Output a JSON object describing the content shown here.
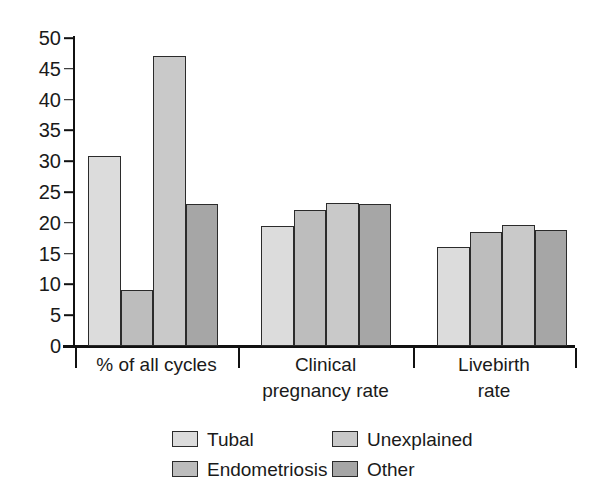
{
  "chart_data": {
    "type": "bar",
    "title": "",
    "subtitle": "",
    "xlabel": "",
    "ylabel": "",
    "ylim": [
      0,
      50
    ],
    "yticks": [
      0,
      5,
      10,
      15,
      20,
      25,
      30,
      35,
      40,
      45,
      50
    ],
    "ytick_labels": [
      "0",
      "5",
      "10",
      "15",
      "20",
      "25",
      "30",
      "35",
      "40",
      "45",
      "50"
    ],
    "grid": false,
    "legend_position": "bottom",
    "categories": [
      "% of all cycles",
      "Clinical\npregnancy rate",
      "Livebirth\nrate"
    ],
    "series": [
      {
        "name": "Tubal",
        "color": "#dcdcdc",
        "values": [
          30.8,
          19.5,
          16.1
        ]
      },
      {
        "name": "Endometriosis",
        "color": "#bdbdbd",
        "values": [
          9.1,
          22.1,
          18.5
        ]
      },
      {
        "name": "Unexplained",
        "color": "#c9c9c9",
        "values": [
          47.0,
          23.2,
          19.7
        ]
      },
      {
        "name": "Other",
        "color": "#a6a6a6",
        "values": [
          23.0,
          23.0,
          18.8
        ]
      }
    ]
  },
  "legend": {
    "items": [
      {
        "label": "Tubal",
        "swatch": "#dcdcdc"
      },
      {
        "label": "Unexplained",
        "swatch": "#c9c9c9"
      },
      {
        "label": "Endometriosis",
        "swatch": "#bdbdbd"
      },
      {
        "label": "Other",
        "swatch": "#a6a6a6"
      }
    ]
  }
}
